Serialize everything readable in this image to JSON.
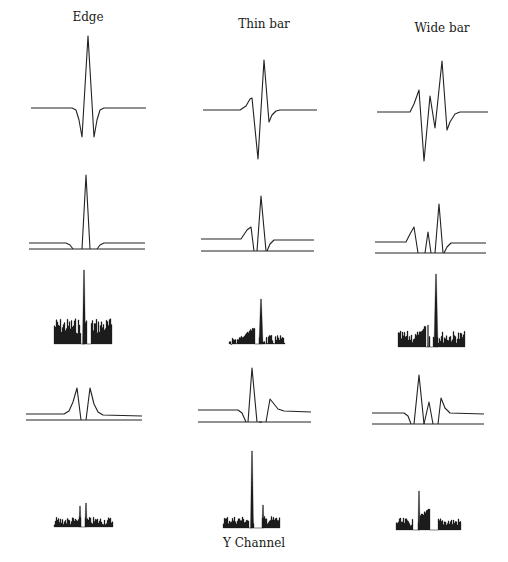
{
  "columns": [
    {
      "title": "Edge",
      "label_x": 88,
      "label_y": 10
    },
    {
      "title": "Thin bar",
      "label_x": 264,
      "label_y": 17
    },
    {
      "title": "Wide bar",
      "label_x": 442,
      "label_y": 21
    }
  ],
  "caption": {
    "text": "Y Channel",
    "x": 254,
    "y": 536
  },
  "colors": {
    "ink": "#222222",
    "background": "#ffffff"
  },
  "panels": [
    {
      "row": 1,
      "col": "Edge",
      "kind": "filter_response",
      "points": [
        [
          31,
          108
        ],
        [
          72,
          108
        ],
        [
          76,
          110
        ],
        [
          79,
          120
        ],
        [
          82,
          137
        ],
        [
          88,
          36
        ],
        [
          94,
          137
        ],
        [
          97,
          120
        ],
        [
          100,
          110
        ],
        [
          104,
          108
        ],
        [
          146,
          108
        ]
      ]
    },
    {
      "row": 1,
      "col": "Thin bar",
      "kind": "filter_response",
      "points": [
        [
          203,
          110
        ],
        [
          240,
          110
        ],
        [
          246,
          106
        ],
        [
          250,
          99
        ],
        [
          252,
          98
        ],
        [
          258,
          159
        ],
        [
          264,
          60
        ],
        [
          269,
          122
        ],
        [
          272,
          115
        ],
        [
          276,
          111
        ],
        [
          280,
          110
        ],
        [
          317,
          110
        ]
      ]
    },
    {
      "row": 1,
      "col": "Wide bar",
      "kind": "filter_response",
      "points": [
        [
          377,
          112
        ],
        [
          410,
          112
        ],
        [
          414,
          104
        ],
        [
          419,
          90
        ],
        [
          424,
          161
        ],
        [
          430,
          96
        ],
        [
          435,
          128
        ],
        [
          442,
          61
        ],
        [
          447,
          130
        ],
        [
          450,
          122
        ],
        [
          455,
          114
        ],
        [
          460,
          112
        ],
        [
          488,
          112
        ]
      ]
    },
    {
      "row": 2,
      "col": "Edge",
      "kind": "rectified_response",
      "upper": [
        [
          29,
          243
        ],
        [
          66,
          243
        ],
        [
          70,
          245
        ],
        [
          73,
          249
        ]
      ],
      "upper2": [
        [
          97,
          249
        ],
        [
          100,
          245
        ],
        [
          104,
          243
        ],
        [
          145,
          243
        ]
      ],
      "spike": [
        [
          82,
          249
        ],
        [
          86,
          175
        ],
        [
          90,
          249
        ]
      ],
      "base": [
        [
          29,
          249
        ],
        [
          145,
          249
        ]
      ]
    },
    {
      "row": 2,
      "col": "Thin bar",
      "kind": "rectified_response",
      "upper": [
        [
          201,
          239
        ],
        [
          241,
          239
        ],
        [
          247,
          230
        ],
        [
          251,
          227
        ],
        [
          254,
          251
        ]
      ],
      "upper2": [
        [
          267,
          251
        ],
        [
          270,
          244
        ],
        [
          274,
          240
        ],
        [
          314,
          240
        ]
      ],
      "spike": [
        [
          257,
          251
        ],
        [
          261,
          196
        ],
        [
          266,
          251
        ]
      ],
      "base": [
        [
          201,
          251
        ],
        [
          314,
          251
        ]
      ]
    },
    {
      "row": 2,
      "col": "Wide bar",
      "kind": "rectified_response",
      "upper": [
        [
          375,
          242
        ],
        [
          406,
          242
        ],
        [
          410,
          234
        ],
        [
          414,
          227
        ],
        [
          418,
          253
        ]
      ],
      "upper2": [
        [
          444,
          253
        ],
        [
          447,
          247
        ],
        [
          451,
          243
        ],
        [
          486,
          243
        ]
      ],
      "spike": [
        [
          425,
          253
        ],
        [
          428,
          232
        ],
        [
          431,
          253
        ]
      ],
      "spike2": [
        [
          435,
          253
        ],
        [
          439,
          204
        ],
        [
          443,
          253
        ]
      ],
      "base": [
        [
          375,
          253
        ],
        [
          486,
          253
        ]
      ]
    },
    {
      "row": 4,
      "col": "Edge",
      "kind": "rectified_response",
      "upper": [
        [
          26,
          414
        ],
        [
          64,
          414
        ],
        [
          69,
          411
        ],
        [
          73,
          402
        ],
        [
          77,
          388
        ],
        [
          81,
          420
        ]
      ],
      "upper2": [
        [
          86,
          420
        ],
        [
          90,
          388
        ],
        [
          94,
          404
        ],
        [
          98,
          412
        ],
        [
          103,
          415
        ],
        [
          142,
          416
        ]
      ],
      "base": [
        [
          26,
          420
        ],
        [
          142,
          420
        ]
      ]
    },
    {
      "row": 4,
      "col": "Thin bar",
      "kind": "rectified_response",
      "upper": [
        [
          198,
          410
        ],
        [
          238,
          410
        ],
        [
          242,
          413
        ],
        [
          246,
          422
        ]
      ],
      "upper2": [
        [
          266,
          422
        ],
        [
          270,
          399
        ],
        [
          274,
          404
        ],
        [
          278,
          409
        ],
        [
          284,
          411
        ],
        [
          311,
          412
        ]
      ],
      "spike": [
        [
          248,
          422
        ],
        [
          252,
          368
        ],
        [
          257,
          422
        ]
      ],
      "spike2": [
        [
          259,
          422
        ],
        [
          262,
          422
        ]
      ],
      "base": [
        [
          198,
          422
        ],
        [
          311,
          422
        ]
      ]
    },
    {
      "row": 4,
      "col": "Wide bar",
      "kind": "rectified_response",
      "upper": [
        [
          372,
          413
        ],
        [
          404,
          413
        ],
        [
          408,
          416
        ],
        [
          411,
          424
        ]
      ],
      "upper2": [
        [
          438,
          424
        ],
        [
          441,
          398
        ],
        [
          445,
          408
        ],
        [
          450,
          413
        ],
        [
          484,
          414
        ]
      ],
      "spike": [
        [
          414,
          424
        ],
        [
          419,
          375
        ],
        [
          424,
          424
        ]
      ],
      "spike2": [
        [
          424,
          424
        ],
        [
          429,
          402
        ],
        [
          433,
          424
        ]
      ],
      "base": [
        [
          372,
          424
        ],
        [
          484,
          424
        ]
      ]
    }
  ],
  "histograms": [
    {
      "row": 3,
      "col": "Edge",
      "x0": 54,
      "x1": 111,
      "y_base": 344,
      "noise_top": 326,
      "noise_amp": 8,
      "gaps": [
        [
          81,
          84
        ],
        [
          87,
          90
        ]
      ],
      "peaks": [
        {
          "x": 84,
          "w": 3,
          "y": 270
        }
      ]
    },
    {
      "row": 3,
      "col": "Thin bar",
      "x0": 229,
      "x1": 284,
      "y_base": 344,
      "noise_top": 340,
      "noise_amp": 5,
      "gaps": [
        [
          255,
          258
        ]
      ],
      "ramp": [
        {
          "x0": 240,
          "x1": 254,
          "y_from": 338,
          "y_to": 328
        }
      ],
      "peaks": [
        {
          "x": 261,
          "w": 4,
          "y": 299
        }
      ]
    },
    {
      "row": 3,
      "col": "Wide bar",
      "x0": 398,
      "x1": 464,
      "y_base": 347,
      "noise_top": 337,
      "noise_amp": 6,
      "gaps": [
        [
          426,
          428
        ],
        [
          430,
          432
        ]
      ],
      "ramp": [
        {
          "x0": 418,
          "x1": 425,
          "y_from": 336,
          "y_to": 326
        }
      ],
      "peaks": [
        {
          "x": 436,
          "w": 4,
          "y": 274
        },
        {
          "x": 428,
          "w": 1,
          "y": 325
        }
      ]
    },
    {
      "row": 5,
      "col": "Edge",
      "x0": 54,
      "x1": 112,
      "y_base": 527,
      "noise_top": 521,
      "noise_amp": 4,
      "gaps": [
        [
          81,
          84
        ]
      ],
      "peaks": [
        {
          "x": 80,
          "w": 2,
          "y": 506
        },
        {
          "x": 86,
          "w": 2,
          "y": 503
        }
      ]
    },
    {
      "row": 5,
      "col": "Thin bar",
      "x0": 223,
      "x1": 279,
      "y_base": 528,
      "noise_top": 520,
      "noise_amp": 4,
      "gaps": [
        [
          249,
          251
        ],
        [
          254,
          261
        ]
      ],
      "peaks": [
        {
          "x": 252,
          "w": 3,
          "y": 451
        },
        {
          "x": 263,
          "w": 2,
          "y": 505
        }
      ]
    },
    {
      "row": 5,
      "col": "Wide bar",
      "x0": 396,
      "x1": 460,
      "y_base": 530,
      "noise_top": 522,
      "noise_amp": 4,
      "gaps": [
        [
          413,
          417
        ],
        [
          430,
          437
        ]
      ],
      "ramp": [
        {
          "x0": 420,
          "x1": 429,
          "y_from": 516,
          "y_to": 509
        }
      ],
      "peaks": [
        {
          "x": 419,
          "w": 2,
          "y": 491
        }
      ]
    }
  ]
}
